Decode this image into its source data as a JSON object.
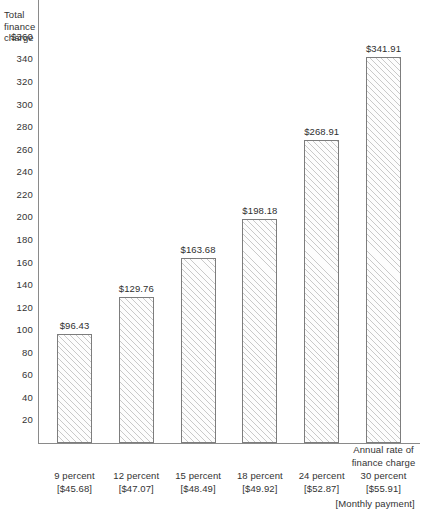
{
  "chart_data": {
    "type": "bar",
    "title": "",
    "ylabel_lines": [
      "Total",
      "finance",
      "charge"
    ],
    "ylabel": "Total finance charge",
    "xlabel": "Annual rate of finance charge",
    "x_sub_label": "[Monthly payment]",
    "categories": [
      "9 percent",
      "12 percent",
      "15 percent",
      "18 percent",
      "24 percent",
      "30 percent"
    ],
    "category_sublabels": [
      "[$45.68]",
      "[$47.07]",
      "[$48.49]",
      "[$49.92]",
      "[$52.87]",
      "[$55.91]"
    ],
    "values": [
      96.43,
      129.76,
      163.68,
      198.18,
      268.91,
      341.91
    ],
    "value_labels": [
      "$96.43",
      "$129.76",
      "$163.68",
      "$198.18",
      "$268.91",
      "$341.91"
    ],
    "ylim": [
      0,
      370
    ],
    "ytick_values": [
      20,
      40,
      60,
      80,
      100,
      120,
      140,
      160,
      180,
      200,
      220,
      240,
      260,
      280,
      300,
      320,
      340,
      360
    ],
    "ytick_labels": [
      "20",
      "40",
      "60",
      "80",
      "100",
      "120",
      "140",
      "160",
      "180",
      "200",
      "220",
      "240",
      "260",
      "280",
      "300",
      "320",
      "340",
      "$360"
    ],
    "grid": false,
    "legend": false,
    "bar_fill": "#fdfdfd",
    "bar_hatch": "diagonal-45",
    "bar_edge_color": "#7d7d7d",
    "axis_color": "#8a8a8a",
    "text_color": "#333333"
  }
}
